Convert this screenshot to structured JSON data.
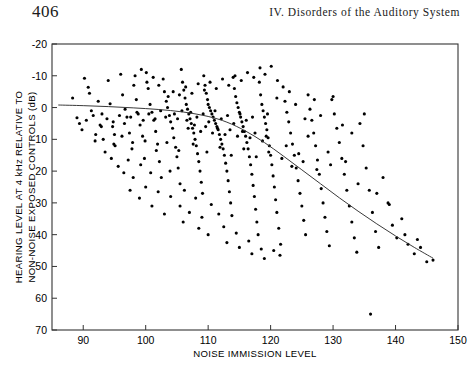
{
  "page": {
    "number": "406",
    "running_title": "IV. Disorders of the Auditory System"
  },
  "chart_data": {
    "type": "scatter",
    "title": "",
    "xlabel": "NOISE IMMISSION LEVEL",
    "ylabel": "HEARING LEVEL AT 4 kHz RELATIVE TO NON-NOISE EXPOSED CONTROLS (dB)",
    "ylabel_line1": "HEARING LEVEL AT 4 kHz RELATIVE TO",
    "ylabel_line2": "NON-NOISE EXPOSED CONTROLS (dB)",
    "xlim": [
      85,
      150
    ],
    "ylim": [
      -20,
      70
    ],
    "y_axis_inverted": true,
    "grid": false,
    "legend": "none",
    "xticks": [
      90,
      100,
      110,
      120,
      130,
      140,
      150
    ],
    "xtick_labels": [
      "90",
      "100",
      "110",
      "120",
      "130",
      "140",
      "150"
    ],
    "yticks": [
      -20,
      -10,
      0,
      10,
      20,
      30,
      40,
      50,
      60,
      70
    ],
    "ytick_labels": [
      "-20",
      "-10",
      "0",
      "10",
      "20",
      "30",
      "40",
      "50",
      "60",
      "70"
    ],
    "marker": {
      "shape": "circle",
      "color": "#000000",
      "size_px": 3.1
    },
    "fit_curve": {
      "name": "fitted trend",
      "color": "#3a3a3a",
      "width_px": 1.0,
      "x": [
        86,
        90,
        94,
        98,
        102,
        106,
        110,
        113,
        116,
        119,
        122,
        125,
        128,
        131,
        134,
        137,
        140,
        143,
        146
      ],
      "y": [
        -0.8,
        -0.6,
        -0.3,
        0.1,
        0.6,
        1.4,
        2.8,
        4.6,
        7.4,
        11.0,
        15.2,
        19.6,
        24.0,
        28.4,
        32.6,
        36.6,
        40.4,
        44.0,
        47.4
      ]
    },
    "points": [
      [
        88.3,
        -3.0
      ],
      [
        89.0,
        3.2
      ],
      [
        89.4,
        5.0
      ],
      [
        90.2,
        -9.2
      ],
      [
        90.8,
        -6.4
      ],
      [
        91.3,
        1.0
      ],
      [
        91.9,
        10.5
      ],
      [
        92.4,
        -2.0
      ],
      [
        92.9,
        6.0
      ],
      [
        93.5,
        14.0
      ],
      [
        94.0,
        -8.5
      ],
      [
        94.3,
        -1.2
      ],
      [
        94.8,
        4.5
      ],
      [
        95.1,
        12.0
      ],
      [
        95.6,
        18.5
      ],
      [
        96.0,
        -10.5
      ],
      [
        96.3,
        -4.0
      ],
      [
        96.7,
        0.5
      ],
      [
        97.0,
        3.0
      ],
      [
        97.4,
        8.0
      ],
      [
        97.8,
        13.0
      ],
      [
        98.1,
        -7.0
      ],
      [
        98.5,
        -2.5
      ],
      [
        98.8,
        2.0
      ],
      [
        99.1,
        5.5
      ],
      [
        99.5,
        9.0
      ],
      [
        99.8,
        16.0
      ],
      [
        100.1,
        -11.0
      ],
      [
        100.4,
        -6.0
      ],
      [
        100.7,
        -1.0
      ],
      [
        101.0,
        1.5
      ],
      [
        101.3,
        4.0
      ],
      [
        101.6,
        7.5
      ],
      [
        101.9,
        11.5
      ],
      [
        102.2,
        17.0
      ],
      [
        102.5,
        22.0
      ],
      [
        102.8,
        -9.0
      ],
      [
        103.0,
        -5.0
      ],
      [
        103.3,
        -2.0
      ],
      [
        103.5,
        0.0
      ],
      [
        103.8,
        2.5
      ],
      [
        104.0,
        4.5
      ],
      [
        104.3,
        6.5
      ],
      [
        104.5,
        9.5
      ],
      [
        104.8,
        12.5
      ],
      [
        105.0,
        15.5
      ],
      [
        105.2,
        19.0
      ],
      [
        105.5,
        24.0
      ],
      [
        105.7,
        -12.0
      ],
      [
        105.9,
        -8.0
      ],
      [
        106.1,
        -5.5
      ],
      [
        106.3,
        -3.0
      ],
      [
        106.5,
        -1.0
      ],
      [
        106.7,
        0.5
      ],
      [
        106.9,
        2.0
      ],
      [
        107.1,
        3.5
      ],
      [
        107.3,
        5.0
      ],
      [
        107.5,
        6.5
      ],
      [
        107.7,
        8.0
      ],
      [
        107.9,
        10.0
      ],
      [
        108.1,
        12.0
      ],
      [
        108.3,
        14.5
      ],
      [
        108.5,
        17.0
      ],
      [
        108.7,
        20.0
      ],
      [
        108.9,
        23.5
      ],
      [
        109.1,
        27.0
      ],
      [
        109.3,
        -10.0
      ],
      [
        109.5,
        -7.0
      ],
      [
        109.7,
        -4.5
      ],
      [
        109.9,
        -2.5
      ],
      [
        110.0,
        -1.0
      ],
      [
        110.2,
        0.0
      ],
      [
        110.4,
        1.0
      ],
      [
        110.6,
        2.0
      ],
      [
        110.8,
        3.0
      ],
      [
        111.0,
        4.0
      ],
      [
        111.2,
        5.0
      ],
      [
        111.4,
        6.0
      ],
      [
        111.6,
        7.0
      ],
      [
        111.8,
        8.5
      ],
      [
        112.0,
        10.0
      ],
      [
        112.2,
        11.5
      ],
      [
        112.4,
        13.0
      ],
      [
        112.6,
        15.0
      ],
      [
        112.8,
        17.5
      ],
      [
        113.0,
        20.0
      ],
      [
        113.2,
        23.0
      ],
      [
        113.4,
        26.5
      ],
      [
        113.6,
        30.0
      ],
      [
        113.8,
        34.0
      ],
      [
        114.0,
        -9.5
      ],
      [
        114.2,
        -6.0
      ],
      [
        114.4,
        -3.5
      ],
      [
        114.6,
        -1.5
      ],
      [
        114.8,
        0.0
      ],
      [
        115.0,
        1.5
      ],
      [
        115.2,
        3.0
      ],
      [
        115.4,
        4.5
      ],
      [
        115.6,
        6.0
      ],
      [
        115.8,
        7.5
      ],
      [
        116.0,
        9.0
      ],
      [
        116.2,
        11.0
      ],
      [
        116.4,
        13.0
      ],
      [
        116.6,
        15.5
      ],
      [
        116.8,
        18.0
      ],
      [
        117.0,
        21.0
      ],
      [
        117.2,
        24.5
      ],
      [
        117.4,
        28.0
      ],
      [
        117.6,
        32.0
      ],
      [
        117.8,
        36.0
      ],
      [
        118.0,
        40.0
      ],
      [
        118.2,
        -8.0
      ],
      [
        118.4,
        -4.0
      ],
      [
        118.6,
        -1.0
      ],
      [
        118.8,
        1.0
      ],
      [
        119.0,
        3.0
      ],
      [
        119.2,
        5.0
      ],
      [
        119.4,
        7.0
      ],
      [
        119.6,
        9.5
      ],
      [
        119.8,
        12.0
      ],
      [
        120.0,
        15.0
      ],
      [
        120.2,
        18.0
      ],
      [
        120.4,
        21.5
      ],
      [
        120.6,
        25.0
      ],
      [
        120.8,
        29.0
      ],
      [
        121.0,
        33.0
      ],
      [
        121.3,
        38.0
      ],
      [
        121.6,
        43.0
      ],
      [
        122.0,
        -6.5
      ],
      [
        122.3,
        -2.0
      ],
      [
        122.6,
        1.5
      ],
      [
        122.9,
        4.5
      ],
      [
        123.2,
        8.0
      ],
      [
        123.5,
        11.5
      ],
      [
        123.8,
        15.0
      ],
      [
        124.1,
        19.0
      ],
      [
        124.4,
        23.0
      ],
      [
        124.7,
        27.0
      ],
      [
        125.0,
        31.0
      ],
      [
        125.3,
        35.5
      ],
      [
        125.6,
        40.0
      ],
      [
        126.0,
        -4.0
      ],
      [
        126.3,
        0.5
      ],
      [
        126.6,
        4.0
      ],
      [
        126.9,
        8.0
      ],
      [
        127.2,
        12.0
      ],
      [
        127.5,
        16.5
      ],
      [
        127.8,
        21.0
      ],
      [
        128.1,
        25.5
      ],
      [
        128.4,
        30.0
      ],
      [
        128.7,
        34.5
      ],
      [
        129.0,
        39.0
      ],
      [
        129.4,
        43.5
      ],
      [
        129.8,
        -2.5
      ],
      [
        130.2,
        2.0
      ],
      [
        130.6,
        6.5
      ],
      [
        131.0,
        11.0
      ],
      [
        131.4,
        16.0
      ],
      [
        131.8,
        21.0
      ],
      [
        132.2,
        26.0
      ],
      [
        132.6,
        31.0
      ],
      [
        133.0,
        36.0
      ],
      [
        133.4,
        41.0
      ],
      [
        133.8,
        45.5
      ],
      [
        134.3,
        5.0
      ],
      [
        134.8,
        12.0
      ],
      [
        135.3,
        19.0
      ],
      [
        135.8,
        26.0
      ],
      [
        136.3,
        33.0
      ],
      [
        136.8,
        39.0
      ],
      [
        136.0,
        65.0
      ],
      [
        137.3,
        44.0
      ],
      [
        138.0,
        22.0
      ],
      [
        138.8,
        30.0
      ],
      [
        139.5,
        37.0
      ],
      [
        140.2,
        41.0
      ],
      [
        141.0,
        35.0
      ],
      [
        142.0,
        43.0
      ],
      [
        143.0,
        46.0
      ],
      [
        144.0,
        44.0
      ],
      [
        145.0,
        48.5
      ],
      [
        146.0,
        48.0
      ],
      [
        100.8,
        20.5
      ],
      [
        103.9,
        20.0
      ],
      [
        106.2,
        26.0
      ],
      [
        110.5,
        30.5
      ],
      [
        111.7,
        33.5
      ],
      [
        108.0,
        28.5
      ],
      [
        99.2,
        18.0
      ],
      [
        97.2,
        16.5
      ],
      [
        95.0,
        8.5
      ],
      [
        93.0,
        2.0
      ],
      [
        91.0,
        -4.5
      ],
      [
        92.0,
        8.5
      ],
      [
        94.5,
        16.0
      ],
      [
        96.5,
        20.5
      ],
      [
        98.0,
        22.0
      ],
      [
        100.0,
        25.0
      ],
      [
        102.0,
        26.5
      ],
      [
        104.0,
        28.0
      ],
      [
        105.5,
        31.0
      ],
      [
        107.0,
        33.0
      ],
      [
        109.0,
        34.5
      ],
      [
        112.5,
        37.5
      ],
      [
        114.5,
        39.5
      ],
      [
        116.5,
        42.0
      ],
      [
        118.5,
        44.5
      ],
      [
        120.5,
        45.0
      ],
      [
        110.0,
        40.0
      ],
      [
        113.0,
        42.5
      ],
      [
        115.0,
        44.0
      ],
      [
        117.0,
        46.0
      ],
      [
        119.0,
        47.5
      ],
      [
        121.5,
        46.5
      ],
      [
        108.5,
        38.0
      ],
      [
        106.0,
        36.0
      ],
      [
        103.0,
        33.5
      ],
      [
        101.0,
        31.0
      ],
      [
        99.0,
        28.5
      ],
      [
        97.5,
        26.0
      ],
      [
        119.5,
        2.0
      ],
      [
        121.0,
        -3.0
      ],
      [
        123.0,
        -5.0
      ],
      [
        124.0,
        -1.0
      ],
      [
        125.5,
        3.5
      ],
      [
        127.0,
        -2.5
      ],
      [
        128.0,
        2.5
      ],
      [
        130.0,
        -3.5
      ],
      [
        131.5,
        5.5
      ],
      [
        133.0,
        8.0
      ],
      [
        135.0,
        2.0
      ],
      [
        126.0,
        9.0
      ],
      [
        122.5,
        12.0
      ],
      [
        124.5,
        14.5
      ],
      [
        129.2,
        14.0
      ],
      [
        132.0,
        17.0
      ],
      [
        134.0,
        24.0
      ],
      [
        137.0,
        27.0
      ],
      [
        139.0,
        30.5
      ],
      [
        141.5,
        40.0
      ],
      [
        143.5,
        41.5
      ],
      [
        104.6,
        2.0
      ],
      [
        105.1,
        3.5
      ],
      [
        105.8,
        1.0
      ],
      [
        106.6,
        4.0
      ],
      [
        107.2,
        1.5
      ],
      [
        108.2,
        3.0
      ],
      [
        109.2,
        2.0
      ],
      [
        110.1,
        4.5
      ],
      [
        111.1,
        1.0
      ],
      [
        112.1,
        3.5
      ],
      [
        113.1,
        2.5
      ],
      [
        114.1,
        5.0
      ],
      [
        115.1,
        2.0
      ],
      [
        116.1,
        4.0
      ],
      [
        117.1,
        3.0
      ],
      [
        103.2,
        3.0
      ],
      [
        102.4,
        1.0
      ],
      [
        101.5,
        3.5
      ],
      [
        100.5,
        2.0
      ],
      [
        99.6,
        4.0
      ],
      [
        98.6,
        1.5
      ],
      [
        97.6,
        3.0
      ],
      [
        96.6,
        5.0
      ],
      [
        95.8,
        2.5
      ],
      [
        94.7,
        6.0
      ],
      [
        93.8,
        3.5
      ],
      [
        92.7,
        5.5
      ],
      [
        91.6,
        2.5
      ],
      [
        90.5,
        4.0
      ],
      [
        89.8,
        7.0
      ],
      [
        106.8,
        6.5
      ],
      [
        107.8,
        5.5
      ],
      [
        108.8,
        7.5
      ],
      [
        109.6,
        6.0
      ],
      [
        110.7,
        8.0
      ],
      [
        111.5,
        6.5
      ],
      [
        112.7,
        8.5
      ],
      [
        113.5,
        7.0
      ],
      [
        114.7,
        9.0
      ],
      [
        115.5,
        7.5
      ],
      [
        116.7,
        9.5
      ],
      [
        117.5,
        8.0
      ],
      [
        118.7,
        10.5
      ],
      [
        119.3,
        9.0
      ],
      [
        103.6,
        -3.5
      ],
      [
        104.4,
        -5.0
      ],
      [
        105.4,
        -4.0
      ],
      [
        106.4,
        -6.5
      ],
      [
        107.4,
        -4.5
      ],
      [
        108.4,
        -7.5
      ],
      [
        109.4,
        -5.5
      ],
      [
        110.3,
        -8.0
      ],
      [
        111.3,
        -6.0
      ],
      [
        112.3,
        -9.0
      ],
      [
        113.3,
        -7.0
      ],
      [
        114.3,
        -10.0
      ],
      [
        115.3,
        -8.5
      ],
      [
        116.3,
        -11.0
      ],
      [
        117.3,
        -9.5
      ],
      [
        102.1,
        -7.0
      ],
      [
        101.2,
        -9.5
      ],
      [
        100.2,
        -8.0
      ],
      [
        99.3,
        -12.0
      ],
      [
        98.3,
        -10.0
      ],
      [
        118.3,
        -12.5
      ],
      [
        119.1,
        -10.5
      ],
      [
        120.1,
        -13.0
      ],
      [
        121.1,
        -8.5
      ],
      [
        93.2,
        10.0
      ],
      [
        94.9,
        11.5
      ],
      [
        96.2,
        9.0
      ],
      [
        97.9,
        11.0
      ],
      [
        99.9,
        10.5
      ],
      [
        101.7,
        13.5
      ],
      [
        103.4,
        11.0
      ],
      [
        105.3,
        13.5
      ],
      [
        107.6,
        11.5
      ],
      [
        109.8,
        14.0
      ],
      [
        111.9,
        12.5
      ],
      [
        113.7,
        15.0
      ],
      [
        115.7,
        13.0
      ],
      [
        117.7,
        15.5
      ],
      [
        119.7,
        14.0
      ],
      [
        121.8,
        16.0
      ],
      [
        123.4,
        18.5
      ],
      [
        125.2,
        17.0
      ],
      [
        127.4,
        19.5
      ],
      [
        129.6,
        18.0
      ]
    ]
  }
}
